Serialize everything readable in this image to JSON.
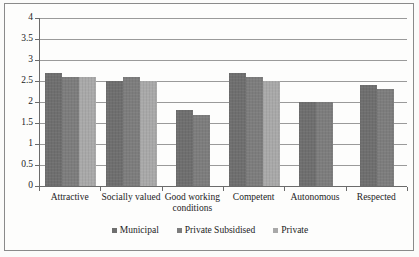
{
  "chart_data": {
    "type": "bar",
    "title": "",
    "subtitle": "",
    "xlabel": "",
    "ylabel": "",
    "ylim": [
      0,
      4
    ],
    "ytick_labels": [
      "0",
      "0.5",
      "1",
      "1.5",
      "2",
      "2.5",
      "3",
      "3.5",
      "4"
    ],
    "ytick_values": [
      0,
      0.5,
      1,
      1.5,
      2,
      2.5,
      3,
      3.5,
      4
    ],
    "grid": true,
    "legend_position": "bottom-center",
    "categories": [
      "Attractive",
      "Socially valued",
      "Good working conditions",
      "Competent",
      "Autonomous",
      "Respected"
    ],
    "series": [
      {
        "name": "Municipal",
        "color": "#6f6f6f",
        "values": [
          2.7,
          2.5,
          1.8,
          2.7,
          2.0,
          2.4
        ]
      },
      {
        "name": "Private Subsidised",
        "color": "#7d7d7d",
        "values": [
          2.6,
          2.6,
          1.7,
          2.6,
          2.0,
          2.3
        ]
      },
      {
        "name": "Private",
        "color": "#a9a9a9",
        "values": [
          2.6,
          2.5,
          null,
          2.5,
          null,
          null
        ]
      }
    ]
  },
  "legend": {
    "items": [
      {
        "label": "Municipal",
        "series": 0
      },
      {
        "label": "Private Subsidised",
        "series": 1
      },
      {
        "label": "Private",
        "series": 2
      }
    ]
  }
}
